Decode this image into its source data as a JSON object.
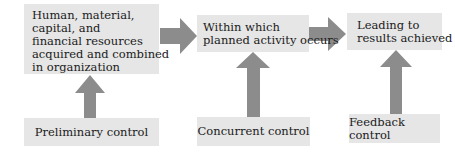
{
  "diagram": {
    "type": "flowchart",
    "stages": [
      {
        "id": "inputs",
        "lines": [
          "Human, material,",
          "capital, and",
          "financial resources",
          "acquired and combined",
          "in organization"
        ]
      },
      {
        "id": "process",
        "lines": [
          "Within which",
          "planned activity occurs"
        ]
      },
      {
        "id": "outputs",
        "lines": [
          "Leading to",
          "results achieved"
        ]
      }
    ],
    "controls": [
      {
        "id": "preliminary",
        "label": "Preliminary control",
        "targets": "inputs"
      },
      {
        "id": "concurrent",
        "label": "Concurrent control",
        "targets": "process"
      },
      {
        "id": "feedback",
        "label": "Feedback control",
        "targets": "outputs"
      }
    ],
    "colors": {
      "box_fill": "#e6e6e6",
      "arrow_fill": "#8c8c8c",
      "text": "#1a1a1a"
    }
  }
}
